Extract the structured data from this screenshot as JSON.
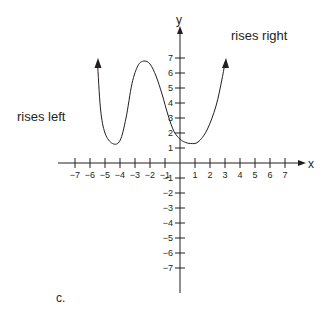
{
  "chart_data": {
    "type": "line",
    "title": "",
    "xlabel": "x",
    "ylabel": "y",
    "xlim": [
      -7,
      7
    ],
    "ylim": [
      -7,
      7
    ],
    "grid": false,
    "x_ticks": [
      -7,
      -6,
      -5,
      -4,
      -3,
      -2,
      -1,
      1,
      2,
      3,
      4,
      5,
      6,
      7
    ],
    "y_ticks": [
      7,
      6,
      5,
      4,
      3,
      2,
      1,
      -1,
      -2,
      -3,
      -4,
      -5,
      -6,
      -7
    ],
    "x_tick_labels": [
      "−7",
      "−6",
      "−5",
      "−4",
      "−3",
      "−2",
      "−1",
      "1",
      "2",
      "3",
      "4",
      "5",
      "6",
      "7"
    ],
    "y_tick_labels": [
      "7",
      "6",
      "5",
      "4",
      "3",
      "2",
      "1",
      "−1",
      "−2",
      "−3",
      "−4",
      "−5",
      "−6",
      "−7"
    ],
    "series": [
      {
        "name": "polynomial curve",
        "x": [
          -5.5,
          -5.3,
          -5.0,
          -4.5,
          -4.0,
          -3.6,
          -3.2,
          -2.8,
          -2.4,
          -2.0,
          -1.6,
          -1.2,
          -0.8,
          -0.4,
          0.0,
          0.3,
          0.7,
          1.2,
          1.8,
          2.4,
          2.8,
          3.0
        ],
        "y": [
          6.7,
          3.6,
          2.0,
          1.3,
          1.5,
          3.0,
          5.3,
          6.5,
          6.8,
          6.6,
          5.8,
          4.6,
          3.2,
          2.1,
          1.6,
          1.4,
          1.3,
          1.4,
          2.2,
          3.8,
          5.6,
          6.7
        ]
      }
    ],
    "annotations": [
      {
        "text": "rises left",
        "x": -10.5,
        "y": 3.0
      },
      {
        "text": "rises right",
        "x": 3.5,
        "y": 7.3
      }
    ],
    "end_behavior": {
      "left": "rises",
      "right": "rises"
    },
    "caption": "c."
  },
  "labels": {
    "x_axis": "x",
    "y_axis": "y",
    "rises_left": "rises left",
    "rises_right": "rises right",
    "caption": "c."
  }
}
